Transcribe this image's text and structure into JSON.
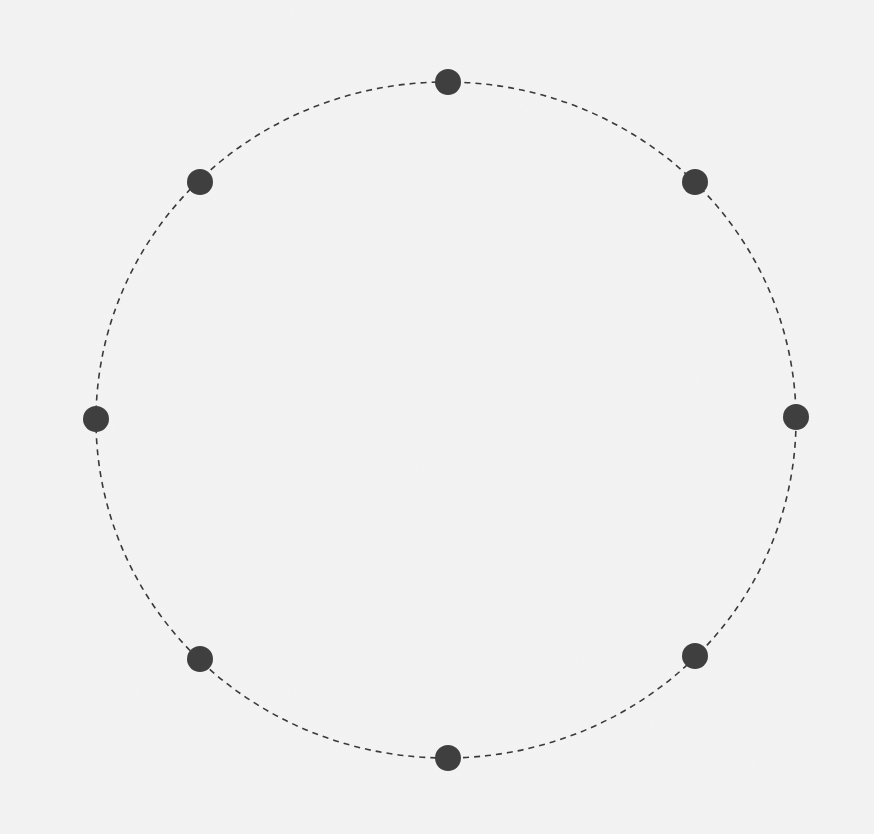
{
  "diagram": {
    "type": "ring",
    "colors": {
      "background": "#f4f4f4",
      "ring_stroke": "#3a3a3a",
      "node_fill": "#3f3f3f"
    },
    "ring": {
      "cx": 446,
      "cy": 420,
      "rx": 350,
      "ry": 338,
      "stroke_width": 1.6,
      "dash": "6 5"
    },
    "node_radius": 13,
    "nodes": [
      {
        "id": "node-top",
        "x": 448,
        "y": 82
      },
      {
        "id": "node-top-right",
        "x": 695,
        "y": 182
      },
      {
        "id": "node-right",
        "x": 796,
        "y": 417
      },
      {
        "id": "node-bottom-right",
        "x": 695,
        "y": 656
      },
      {
        "id": "node-bottom",
        "x": 448,
        "y": 758
      },
      {
        "id": "node-bottom-left",
        "x": 200,
        "y": 659
      },
      {
        "id": "node-left",
        "x": 96,
        "y": 419
      },
      {
        "id": "node-top-left",
        "x": 200,
        "y": 182
      }
    ]
  }
}
